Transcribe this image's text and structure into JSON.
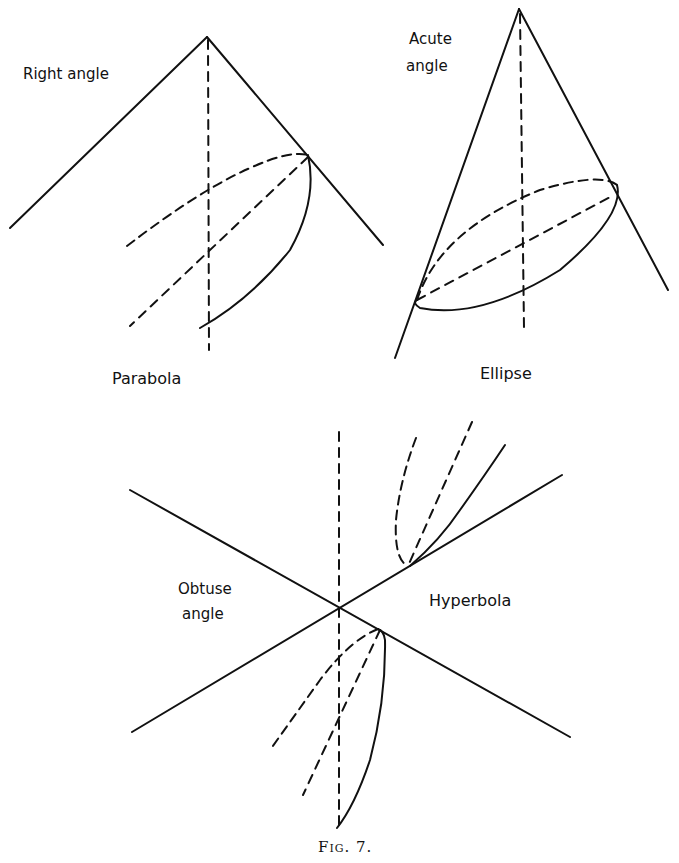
{
  "figure": {
    "caption": "Fig. 7.",
    "panels": [
      {
        "id": "parabola",
        "angle_label": "Right angle",
        "curve_label": "Parabola"
      },
      {
        "id": "ellipse",
        "angle_label_line1": "Acute",
        "angle_label_line2": "angle",
        "curve_label": "Ellipse"
      },
      {
        "id": "hyperbola",
        "angle_label_line1": "Obtuse",
        "angle_label_line2": "angle",
        "curve_label": "Hyperbola"
      }
    ]
  },
  "colors": {
    "ink": "#111111",
    "paper": "#ffffff"
  }
}
